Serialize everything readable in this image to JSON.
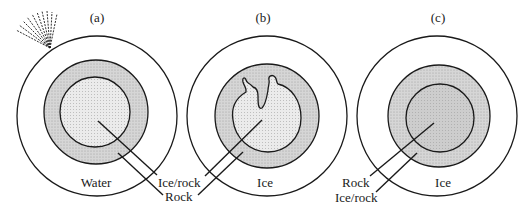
{
  "diagram": {
    "panels": [
      {
        "id": "a",
        "title": "(a)",
        "outer_label": "Water",
        "pointer_labels": [
          "Ice/rock",
          "Rock"
        ],
        "features": [
          "plume"
        ]
      },
      {
        "id": "b",
        "title": "(b)",
        "outer_label": "Ice",
        "pointer_labels": [
          "Ice/rock",
          "Rock"
        ],
        "features": [
          "irregular-core"
        ]
      },
      {
        "id": "c",
        "title": "(c)",
        "outer_label": "Ice",
        "pointer_labels": [
          "Rock",
          "Ice/rock"
        ],
        "features": []
      }
    ],
    "colors": {
      "stroke": "#1a1a1a",
      "ring_fill": "#d4d4d4",
      "core_fill_a": "#e2e2e2",
      "core_fill_b": "#e6e6e6",
      "core_fill_c": "#cfcfcf",
      "background": "#ffffff"
    }
  }
}
